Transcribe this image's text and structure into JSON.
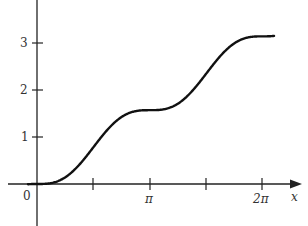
{
  "chart_data": {
    "type": "line",
    "title": "",
    "xlabel": "x",
    "ylabel": "",
    "function": "y = x/2 - sin(2x)/4",
    "xlim": [
      -0.9,
      7.3
    ],
    "ylim": [
      -0.9,
      3.9
    ],
    "x_ticks": [
      {
        "value": 1.5708,
        "label": ""
      },
      {
        "value": 3.1416,
        "label": "π"
      },
      {
        "value": 4.7124,
        "label": ""
      },
      {
        "value": 6.2832,
        "label": "2π"
      }
    ],
    "y_ticks": [
      {
        "value": 1,
        "label": "1"
      },
      {
        "value": 2,
        "label": "2"
      },
      {
        "value": 3,
        "label": "3"
      }
    ],
    "origin_label": "0",
    "grid": false,
    "legend": null,
    "series": [
      {
        "name": "curve",
        "x": [
          -0.3,
          0,
          0.5,
          1.0,
          1.5708,
          2.0,
          2.5,
          3.1416,
          3.5,
          4.0,
          4.7124,
          5.0,
          5.5,
          6.2832,
          6.6
        ],
        "y": [
          -0.004,
          0,
          0.04,
          0.273,
          0.785,
          1.189,
          1.49,
          1.571,
          1.583,
          1.751,
          2.356,
          2.636,
          2.999,
          3.142,
          3.154
        ]
      }
    ],
    "color": "#111111"
  },
  "labels": {
    "origin": "0",
    "y1": "1",
    "y2": "2",
    "y3": "3",
    "xpi": "π",
    "x2pi": "2π",
    "xaxis": "x"
  }
}
